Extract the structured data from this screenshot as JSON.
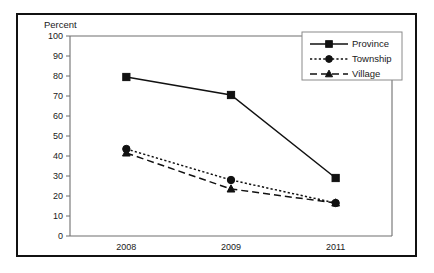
{
  "figure": {
    "axis_title": "Percent",
    "frame_color": "#111111",
    "axis_color": "#6f6f6f",
    "series_color": "#111111",
    "background": "#ffffff"
  },
  "chart_data": {
    "type": "line",
    "title": "",
    "xlabel": "",
    "ylabel": "Percent",
    "categories": [
      "2008",
      "2009",
      "2011"
    ],
    "ylim": [
      0,
      100
    ],
    "yticks": [
      0,
      10,
      20,
      30,
      40,
      50,
      60,
      70,
      80,
      90,
      100
    ],
    "ytick_labels": [
      "0",
      "10",
      "20",
      "30",
      "40",
      "50",
      "60",
      "70",
      "80",
      "90",
      "100"
    ],
    "grid": false,
    "legend_position": "top-right",
    "series": [
      {
        "name": "Province",
        "values": [
          79.5,
          70.5,
          29.0
        ],
        "line_style": "solid",
        "marker": "square"
      },
      {
        "name": "Township",
        "values": [
          43.5,
          28.0,
          16.5
        ],
        "line_style": "dotted",
        "marker": "circle"
      },
      {
        "name": "Village",
        "values": [
          41.5,
          23.5,
          16.5
        ],
        "line_style": "dashed",
        "marker": "triangle"
      }
    ]
  }
}
